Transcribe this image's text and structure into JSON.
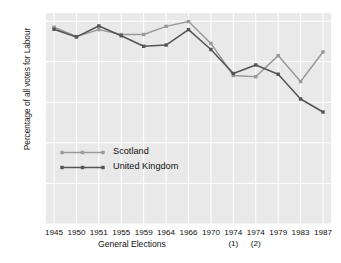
{
  "chart_data": {
    "type": "line",
    "title": "",
    "xlabel": "General Elections",
    "ylabel": "Percentage of all votes for Labour",
    "categories": [
      "1945",
      "1950",
      "1951",
      "1955",
      "1959",
      "1964",
      "1966",
      "1970",
      "1974",
      "1974",
      "1979",
      "1983",
      "1987"
    ],
    "category_sublabels": [
      "",
      "",
      "",
      "",
      "",
      "",
      "",
      "",
      "(1)",
      "(2)",
      "",
      "",
      ""
    ],
    "ylim": [
      0,
      52
    ],
    "yticks": [
      0,
      10,
      20,
      30,
      40,
      50
    ],
    "ytick_labels": [
      "0",
      "10",
      "20",
      "30",
      "40",
      "50"
    ],
    "grid": true,
    "legend_position": "center-left",
    "series": [
      {
        "name": "Scotland",
        "color": "#9a9a9a",
        "values": [
          48.5,
          46.2,
          47.9,
          46.7,
          46.7,
          48.7,
          49.9,
          44.5,
          36.6,
          36.3,
          41.5,
          35.1,
          42.4
        ]
      },
      {
        "name": "United Kingdom",
        "color": "#545454",
        "values": [
          48.0,
          46.1,
          48.8,
          46.4,
          43.8,
          44.1,
          47.9,
          43.0,
          37.1,
          39.2,
          36.9,
          30.8,
          27.6
        ]
      }
    ]
  },
  "axes": {
    "y_title": "Percentage of all votes for Labour",
    "x_title": "General Elections",
    "y_labels": [
      "50",
      "40",
      "30",
      "20",
      "10",
      "0"
    ]
  },
  "legend": {
    "items": [
      {
        "label": "Scotland"
      },
      {
        "label": "United Kingdom"
      }
    ]
  },
  "colors": {
    "scotland": "#9a9a9a",
    "united_kingdom": "#545454",
    "plot_background": "#e9e9e9",
    "grid": "#ffffff",
    "figure_background": "#ffffff"
  }
}
